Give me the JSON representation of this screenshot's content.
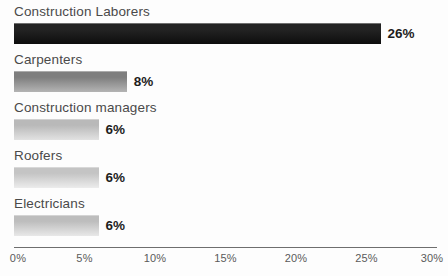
{
  "chart_data": {
    "type": "bar",
    "orientation": "horizontal",
    "title": "",
    "xlabel": "",
    "ylabel": "",
    "categories": [
      "Construction Laborers",
      "Carpenters",
      "Construction managers",
      "Roofers",
      "Electricians"
    ],
    "values": [
      26,
      8,
      6,
      6,
      6
    ],
    "value_labels": [
      "26%",
      "8%",
      "6%",
      "6%",
      "6%"
    ],
    "xlim": [
      0,
      30
    ],
    "xticks": [
      0,
      5,
      10,
      15,
      20,
      25,
      30
    ],
    "xtick_labels": [
      "0%",
      "5%",
      "10%",
      "15%",
      "20%",
      "25%",
      "30%"
    ],
    "grid": false,
    "legend": false,
    "bar_colors": [
      "#1a1a1a",
      "#8a8a8a",
      "#c2c2c2",
      "#cfcfcf",
      "#c9c9c9"
    ],
    "bar_gradients": [
      [
        "#232323",
        "#0d0d0d"
      ],
      [
        "#7e7e7e",
        "#b4b4b4"
      ],
      [
        "#b9b9b9",
        "#e2e2e2"
      ],
      [
        "#c4c4c4",
        "#ececec"
      ],
      [
        "#bdbdbd",
        "#e8e8e8"
      ]
    ],
    "axis_color": "#6e6e6e",
    "label_color": "#4a4a4a",
    "value_color": "#1d1d1d"
  }
}
